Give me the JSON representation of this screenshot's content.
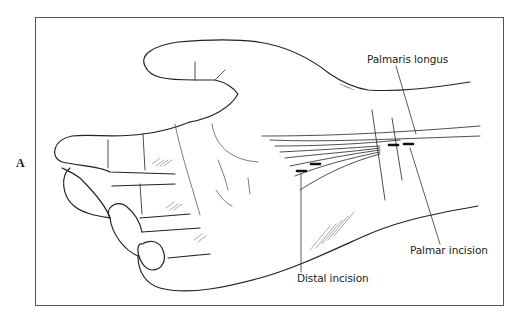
{
  "figure": {
    "panel_label": "A",
    "callouts": [
      {
        "id": "palmaris-longus",
        "text": "Palmaris longus"
      },
      {
        "id": "palmar-incision",
        "text": "Palmar incision"
      },
      {
        "id": "distal-incision",
        "text": "Distal incision"
      }
    ],
    "colors": {
      "line": "#222222",
      "frame": "#555555",
      "background": "#ffffff"
    }
  }
}
